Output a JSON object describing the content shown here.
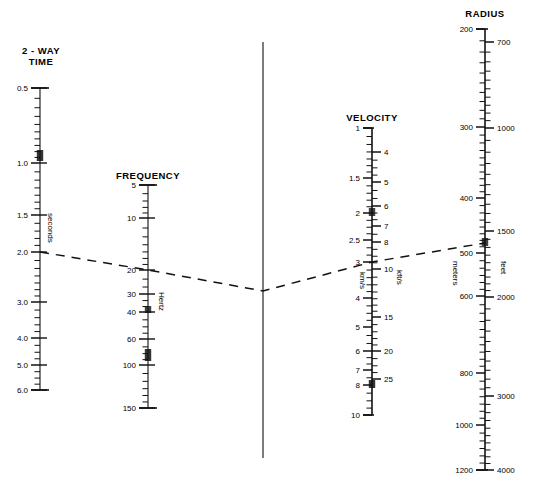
{
  "figure": {
    "kind": "nomogram",
    "background": "#ffffff",
    "ink": "#000000"
  },
  "chart_data": {
    "type": "line",
    "title": "",
    "xlabel": "",
    "ylabel": "",
    "grid": false,
    "legend_position": "none",
    "scales": [
      {
        "name": "2-WAY TIME",
        "unit": "seconds",
        "axis_x": 40,
        "type": "log-descending",
        "label_side": "left",
        "range": [
          0.5,
          6.0
        ],
        "ticks": [
          {
            "value": "0.5",
            "y": 88,
            "major": true
          },
          {
            "value": "1.0",
            "y": 163,
            "major": true
          },
          {
            "value": "1.5",
            "y": 215,
            "major": true
          },
          {
            "value": "2.0",
            "y": 252,
            "major": true
          },
          {
            "value": "3.0",
            "y": 302,
            "major": true
          },
          {
            "value": "4.0",
            "y": 338,
            "major": true
          },
          {
            "value": "5.0",
            "y": 365,
            "major": true
          },
          {
            "value": "6.0",
            "y": 390,
            "major": true
          }
        ]
      },
      {
        "name": "FREQUENCY",
        "unit": "Hertz",
        "axis_x": 148,
        "type": "log-descending",
        "label_side": "left",
        "range": [
          5,
          150
        ],
        "ticks": [
          {
            "value": "5",
            "y": 185,
            "major": true
          },
          {
            "value": "10",
            "y": 218,
            "major": true
          },
          {
            "value": "20",
            "y": 270,
            "major": true
          },
          {
            "value": "30",
            "y": 294,
            "major": true
          },
          {
            "value": "40",
            "y": 312,
            "major": true
          },
          {
            "value": "60",
            "y": 339,
            "major": true
          },
          {
            "value": "100",
            "y": 365,
            "major": true
          },
          {
            "value": "150",
            "y": 408,
            "major": true
          }
        ]
      },
      {
        "name": "VELOCITY",
        "unit_left": "km/s",
        "unit_right": "kft/s",
        "axis_x": 372,
        "type": "log-descending-dual",
        "range_left": [
          1,
          10
        ],
        "range_right": [
          4,
          25
        ],
        "ticks_left": [
          {
            "value": "1",
            "y": 128,
            "major": true
          },
          {
            "value": "1.5",
            "y": 178,
            "major": true
          },
          {
            "value": "2",
            "y": 213,
            "major": true
          },
          {
            "value": "2.5",
            "y": 240,
            "major": true
          },
          {
            "value": "3",
            "y": 262,
            "major": true
          },
          {
            "value": "4",
            "y": 298,
            "major": true
          },
          {
            "value": "5",
            "y": 327,
            "major": true
          },
          {
            "value": "6",
            "y": 351,
            "major": true
          },
          {
            "value": "7",
            "y": 370,
            "major": true
          },
          {
            "value": "8",
            "y": 385,
            "major": true
          },
          {
            "value": "10",
            "y": 415,
            "major": true
          }
        ],
        "ticks_right": [
          {
            "value": "4",
            "y": 152,
            "major": true
          },
          {
            "value": "5",
            "y": 182,
            "major": true
          },
          {
            "value": "6",
            "y": 206,
            "major": true
          },
          {
            "value": "7",
            "y": 226,
            "major": true
          },
          {
            "value": "8",
            "y": 242,
            "major": true
          },
          {
            "value": "10",
            "y": 269,
            "major": true
          },
          {
            "value": "15",
            "y": 317,
            "major": true
          },
          {
            "value": "20",
            "y": 351,
            "major": true
          },
          {
            "value": "25",
            "y": 379,
            "major": true
          }
        ]
      },
      {
        "name": "RADIUS",
        "unit_left": "meters",
        "unit_right": "feet",
        "axis_x": 485,
        "type": "log-descending-dual",
        "range_left": [
          200,
          1200
        ],
        "range_right": [
          700,
          4000
        ],
        "ticks_left": [
          {
            "value": "200",
            "y": 29,
            "major": true
          },
          {
            "value": "300",
            "y": 127,
            "major": true
          },
          {
            "value": "400",
            "y": 198,
            "major": true
          },
          {
            "value": "500",
            "y": 253,
            "major": true
          },
          {
            "value": "600",
            "y": 296,
            "major": true
          },
          {
            "value": "800",
            "y": 373,
            "major": true
          },
          {
            "value": "1000",
            "y": 425,
            "major": true
          },
          {
            "value": "1200",
            "y": 470,
            "major": true
          }
        ],
        "ticks_right": [
          {
            "value": "700",
            "y": 42,
            "major": true
          },
          {
            "value": "1000",
            "y": 128,
            "major": true
          },
          {
            "value": "1500",
            "y": 231,
            "major": true
          },
          {
            "value": "2000",
            "y": 297,
            "major": true
          },
          {
            "value": "3000",
            "y": 396,
            "major": true
          },
          {
            "value": "4000",
            "y": 470,
            "major": true
          }
        ]
      }
    ],
    "pivot_line": {
      "x": 263,
      "y_top": 42,
      "y_bottom": 458
    },
    "index_line": {
      "style": "dashed",
      "points": [
        {
          "scale": "2-WAY TIME",
          "value": "2.0",
          "x": 40,
          "y": 252
        },
        {
          "scale": "FREQUENCY",
          "value": "20",
          "x": 148,
          "y": 270
        },
        {
          "scale": "PIVOT",
          "value": "",
          "x": 263,
          "y": 291
        },
        {
          "scale": "VELOCITY",
          "value": "3",
          "x": 372,
          "y": 262
        },
        {
          "scale": "RADIUS",
          "value": "480",
          "x": 485,
          "y": 243
        }
      ]
    }
  },
  "titles": {
    "two_way_time": "2 - WAY\nTIME",
    "frequency": "FREQUENCY",
    "velocity": "VELOCITY",
    "radius": "RADIUS"
  },
  "units": {
    "seconds": "seconds",
    "hertz": "Hertz",
    "kms": "km/s",
    "kfts": "kft/s",
    "meters": "meters",
    "feet": "feet"
  }
}
